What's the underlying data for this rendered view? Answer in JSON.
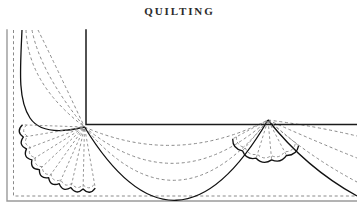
{
  "page": {
    "title": "QUILTING",
    "width": 357,
    "height": 214,
    "background": "#ffffff"
  },
  "colors": {
    "title_text": "#2b2b2b",
    "outer_frame": "#9a9a9a",
    "inner_border": "#1a1a1a",
    "solid_motif": "#111111",
    "dashed_stitch": "#8a8a8a",
    "paper": "#ffffff"
  },
  "illustration": {
    "name": "quilting-corner-pattern",
    "description": "Quilting pattern plate: corner border with fan and swag motif",
    "outer_frame": {
      "left_x": 7,
      "bottom_y": 201,
      "top_y": 30,
      "stroke": "#9a9a9a",
      "stroke_width": 1.4
    },
    "dashed_border": {
      "left_x": 13.5,
      "bottom_y": 196,
      "top_y": 30,
      "stroke": "#8a8a8a",
      "dash": "3,2.6"
    },
    "inner_border": {
      "corner_x": 86,
      "corner_y": 124.5,
      "vertical_top_y": 30,
      "horizontal_right_x": 357,
      "stroke": "#1a1a1a",
      "stroke_width": 1.5
    },
    "fans": [
      {
        "name": "corner-fan-left",
        "center_x": 84.5,
        "center_y": 127,
        "inner_radius": 6,
        "outer_radius": 62,
        "petal_count": 9,
        "start_angle_deg": 182,
        "end_angle_deg": 80,
        "scallop_stroke": "#111111",
        "radial_stroke": "#8a8a8a"
      },
      {
        "name": "corner-fan-right",
        "center_x": 268,
        "center_y": 120,
        "inner_radius": 4,
        "outer_radius": 40,
        "petal_count": 5,
        "start_angle_deg": 152,
        "end_angle_deg": 40,
        "scallop_stroke": "#111111",
        "radial_stroke": "#8a8a8a"
      }
    ],
    "swags": {
      "name": "draped-swag-arcs",
      "from_x": 84.5,
      "from_y": 127,
      "to_x": 268,
      "to_y": 120,
      "dashed_arc_count": 3,
      "solid_bottom_arc": true,
      "stroke_dashed": "#8a8a8a",
      "stroke_solid": "#111111"
    },
    "left_swags": {
      "name": "left-vertical-swag-arcs",
      "top_x": 22,
      "top_y": 30,
      "to_x": 84.5,
      "to_y": 127,
      "dashed_arc_count": 3,
      "solid_outer_arc": true
    },
    "right_trailing_arcs": {
      "name": "right-trailing-dashed-arcs",
      "from_x": 268,
      "from_y": 120,
      "count": 3,
      "extends_to_edge": true
    }
  }
}
